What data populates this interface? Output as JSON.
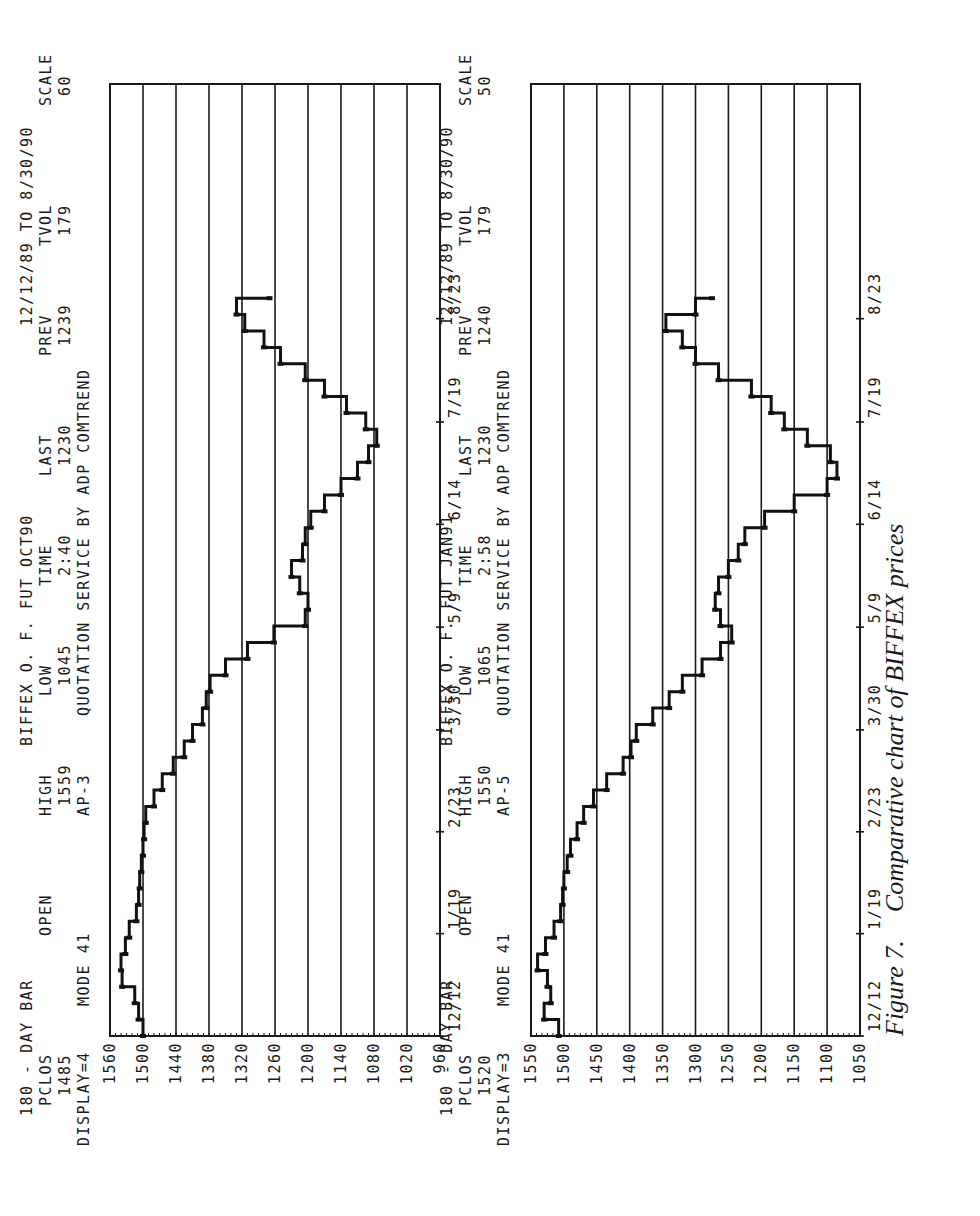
{
  "caption": {
    "number": "Figure 7.",
    "text": "Comparative chart of BIFFEX prices"
  },
  "chart_data": [
    {
      "type": "line",
      "title": "180 - DAY BAR BIFFEX O. F. FUT OCT90 12/12/89 TO 8/30/90",
      "header": {
        "line1": [
          "180 - DAY BAR",
          "BIFFEX O. F. FUT OCT90",
          "12/12/89 TO 8/30/90"
        ],
        "labels": [
          "PCLOS",
          "OPEN",
          "HIGH",
          "LOW",
          "TIME",
          "LAST",
          "PREV",
          "TVOL",
          "SCALE"
        ],
        "values": [
          "1485",
          "",
          "1559",
          "1045",
          "2:40",
          "1230",
          "1239",
          "179",
          "60"
        ],
        "line4": [
          "DISPLAY=4",
          "MODE 41",
          "AP-3",
          "QUOTATION SERVICE BY ADP COMTREND"
        ]
      },
      "xlabel": "",
      "ylabel": "",
      "x_ticks": [
        "12/12",
        "1/19",
        "2/23",
        "3/30",
        "5/9",
        "6/14",
        "7/19",
        "8/23"
      ],
      "y_ticks": [
        1560,
        1500,
        1440,
        1380,
        1320,
        1260,
        1200,
        1140,
        1080,
        1020,
        960
      ],
      "ylim": [
        960,
        1560
      ],
      "grid": true,
      "series": [
        {
          "name": "OCT90",
          "x": [
            0,
            4,
            8,
            12,
            16,
            20,
            24,
            28,
            32,
            36,
            40,
            44,
            48,
            52,
            56,
            60,
            64,
            68,
            72,
            76,
            80,
            84,
            88,
            92,
            96,
            100,
            104,
            108,
            112,
            116,
            120,
            124,
            128,
            132,
            136,
            140,
            144,
            148,
            152,
            156,
            160,
            164,
            168,
            172,
            176,
            180
          ],
          "values": [
            1500,
            1508,
            1515,
            1538,
            1540,
            1532,
            1525,
            1512,
            1508,
            1506,
            1503,
            1500,
            1498,
            1495,
            1480,
            1465,
            1445,
            1425,
            1410,
            1392,
            1385,
            1378,
            1350,
            1310,
            1262,
            1205,
            1200,
            1215,
            1230,
            1210,
            1205,
            1195,
            1170,
            1140,
            1110,
            1090,
            1075,
            1095,
            1130,
            1170,
            1205,
            1250,
            1280,
            1315,
            1330,
            1270
          ]
        }
      ]
    },
    {
      "type": "line",
      "title": "180 - DAY BAR BIFFEX O. F. FUT JAN91 12/12/89 TO 8/30/90",
      "header": {
        "line1": [
          "180 - DAY BAR",
          "BIFFEX O. F. FUT JAN91",
          "12/12/89 TO 8/30/90"
        ],
        "labels": [
          "PCLOS",
          "OPEN",
          "HIGH",
          "LOW",
          "TIME",
          "LAST",
          "PREV",
          "TVOL",
          "SCALE"
        ],
        "values": [
          "1520",
          "",
          "1550",
          "1065",
          "2:58",
          "1230",
          "1240",
          "179",
          "50"
        ],
        "line4": [
          "DISPLAY=3",
          "MODE 41",
          "AP-5",
          "QUOTATION SERVICE BY ADP COMTREND"
        ]
      },
      "xlabel": "",
      "ylabel": "",
      "x_ticks": [
        "12/12",
        "1/19",
        "2/23",
        "3/30",
        "5/9",
        "6/14",
        "7/19",
        "8/23"
      ],
      "y_ticks": [
        1550,
        1500,
        1450,
        1400,
        1350,
        1300,
        1250,
        1200,
        1150,
        1100,
        1050
      ],
      "ylim": [
        1050,
        1550
      ],
      "grid": true,
      "series": [
        {
          "name": "JAN91",
          "x": [
            0,
            4,
            8,
            12,
            16,
            20,
            24,
            28,
            32,
            36,
            40,
            44,
            48,
            52,
            56,
            60,
            64,
            68,
            72,
            76,
            80,
            84,
            88,
            92,
            96,
            100,
            104,
            108,
            112,
            116,
            120,
            124,
            128,
            132,
            136,
            140,
            144,
            148,
            152,
            156,
            160,
            164,
            168,
            172,
            176,
            180
          ],
          "values": [
            1508,
            1530,
            1520,
            1525,
            1540,
            1528,
            1515,
            1505,
            1502,
            1500,
            1495,
            1490,
            1480,
            1470,
            1455,
            1435,
            1410,
            1398,
            1390,
            1365,
            1340,
            1320,
            1290,
            1262,
            1245,
            1262,
            1270,
            1265,
            1250,
            1235,
            1225,
            1195,
            1150,
            1100,
            1085,
            1095,
            1130,
            1165,
            1185,
            1215,
            1265,
            1300,
            1320,
            1345,
            1300,
            1275
          ]
        }
      ]
    }
  ]
}
